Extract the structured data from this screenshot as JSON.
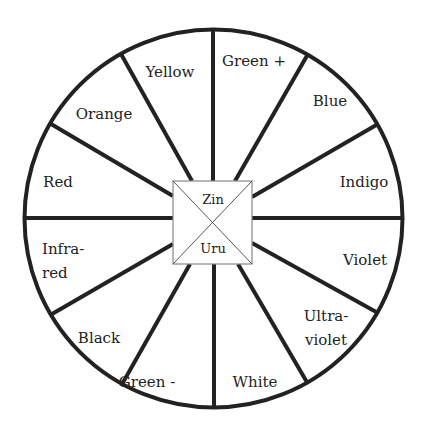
{
  "diagram": {
    "type": "color-wheel",
    "center": {
      "top_label": "Zin",
      "bottom_label": "Uru"
    },
    "segments": [
      {
        "label": "Green +",
        "lines": [
          "Green +"
        ]
      },
      {
        "label": "Blue",
        "lines": [
          "Blue"
        ]
      },
      {
        "label": "Indigo",
        "lines": [
          "Indigo"
        ]
      },
      {
        "label": "Violet",
        "lines": [
          "Violet"
        ]
      },
      {
        "label": "Ultra-violet",
        "lines": [
          "Ultra-",
          "violet"
        ]
      },
      {
        "label": "White",
        "lines": [
          "White"
        ]
      },
      {
        "label": "Green -",
        "lines": [
          "Green -"
        ]
      },
      {
        "label": "Black",
        "lines": [
          "Black"
        ]
      },
      {
        "label": "Infra-red",
        "lines": [
          "Infra-",
          "red"
        ]
      },
      {
        "label": "Red",
        "lines": [
          "Red"
        ]
      },
      {
        "label": "Orange",
        "lines": [
          "Orange"
        ]
      },
      {
        "label": "Yellow",
        "lines": [
          "Yellow"
        ]
      }
    ],
    "colors": {
      "stroke": "#222222",
      "background": "#ffffff"
    }
  }
}
